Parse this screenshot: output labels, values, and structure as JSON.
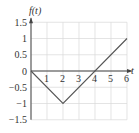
{
  "chart_data": {
    "type": "line",
    "title": "",
    "xlabel": "t",
    "ylabel": "f(t)",
    "x": [
      0,
      2,
      6
    ],
    "series": [
      {
        "name": "f(t)",
        "values": [
          0,
          -1,
          1
        ]
      }
    ],
    "xlim": [
      0,
      6
    ],
    "ylim": [
      -1.5,
      1.5
    ],
    "x_ticks": [
      "1",
      "2",
      "3",
      "4",
      "5",
      "6"
    ],
    "y_ticks": [
      "1.5",
      "1",
      "0.5",
      "0",
      "-0.5",
      "-1",
      "-1.5"
    ],
    "grid": true,
    "legend": "none",
    "colors": {
      "line": "#555555",
      "grid": "#d8d8d8",
      "axis": "#444444"
    }
  },
  "labels": {
    "y_axis": "f(t)",
    "x_axis": "t"
  }
}
